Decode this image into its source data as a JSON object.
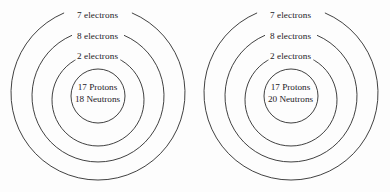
{
  "figure": {
    "type": "bohr-model-atom-diagram-pair",
    "background_color": "#fdfdfd",
    "line_color": "#2b2b2b",
    "text_color": "#23201f"
  },
  "atoms": [
    {
      "id": "atom-left",
      "shells": [
        {
          "index": 3,
          "label": "7 electrons"
        },
        {
          "index": 2,
          "label": "8 electrons"
        },
        {
          "index": 1,
          "label": "2 electrons"
        }
      ],
      "nucleus": {
        "protons_label": "17 Protons",
        "neutrons_label": "18 Neutrons"
      }
    },
    {
      "id": "atom-right",
      "shells": [
        {
          "index": 3,
          "label": "7 electrons"
        },
        {
          "index": 2,
          "label": "8 electrons"
        },
        {
          "index": 1,
          "label": "2 electrons"
        }
      ],
      "nucleus": {
        "protons_label": "17 Protons",
        "neutrons_label": "20 Neutrons"
      }
    }
  ]
}
